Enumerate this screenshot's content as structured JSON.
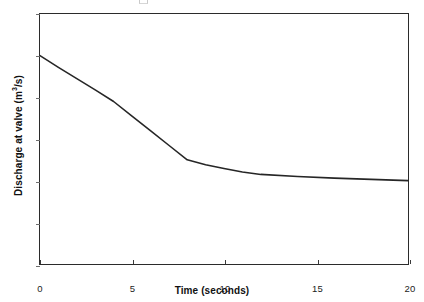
{
  "chart_data": {
    "type": "line",
    "title": "",
    "xlabel": "Time (seconds)",
    "ylabel_prefix": "Discharge at valve (m",
    "ylabel_sup": "3",
    "ylabel_suffix": "/s)",
    "ylabel_plain": "Discharge at valve (m3/s)",
    "xlim": [
      0,
      20
    ],
    "ylim": [
      0,
      6
    ],
    "xticks": [
      0,
      5,
      10,
      15,
      20
    ],
    "yticks": [
      0,
      1,
      2,
      3,
      4,
      5,
      6
    ],
    "xtick_labels": [
      "0",
      "5",
      "10",
      "15",
      "20"
    ],
    "ytick_labels": [
      "0",
      "1",
      "2",
      "3",
      "4",
      "5",
      "6"
    ],
    "grid": false,
    "legend": false,
    "line_color": "#262626",
    "line_width": 1.6,
    "series": [
      {
        "name": "Discharge at valve",
        "x": [
          0,
          1,
          2,
          3,
          4,
          5,
          6,
          7,
          8,
          9,
          10,
          11,
          12,
          14,
          16,
          18,
          20
        ],
        "y": [
          5.0,
          4.72,
          4.45,
          4.18,
          3.9,
          3.55,
          3.2,
          2.85,
          2.5,
          2.38,
          2.29,
          2.21,
          2.15,
          2.1,
          2.06,
          2.03,
          2.0
        ]
      }
    ],
    "annotations": []
  },
  "figure": {
    "background": "#ffffff",
    "axis_color": "#2b2b2b",
    "text_color": "#1a1a1a",
    "plot_left_px": 39,
    "plot_top_px": 13,
    "plot_width_px": 370,
    "plot_height_px": 252
  }
}
